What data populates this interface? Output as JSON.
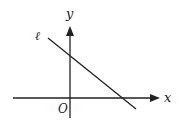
{
  "diagram": {
    "type": "coordinate-plane",
    "axes": {
      "x_label": "x",
      "y_label": "y",
      "origin_label": "O"
    },
    "line": {
      "label": "ℓ",
      "slope_sign": "negative",
      "y_intercept_sign": "positive",
      "x_intercept_sign": "positive"
    },
    "colors": {
      "stroke": "#222222",
      "background": "#ffffff"
    }
  }
}
